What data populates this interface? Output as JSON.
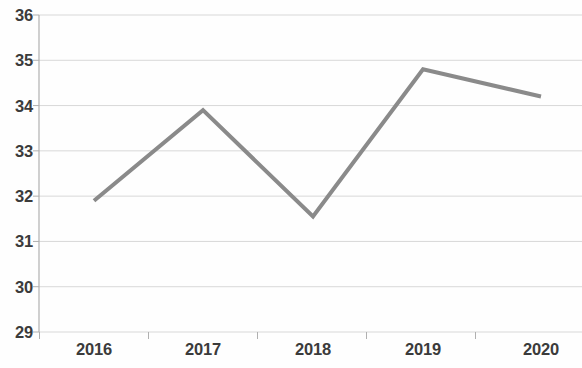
{
  "chart_data": {
    "type": "line",
    "title": "",
    "subtitle": "",
    "xlabel": "",
    "ylabel": "",
    "categories": [
      "2016",
      "2017",
      "2018",
      "2019",
      "2020"
    ],
    "values": [
      31.9,
      33.9,
      31.55,
      34.8,
      34.2
    ],
    "series": [
      {
        "name": "",
        "values": [
          31.9,
          33.9,
          31.55,
          34.8,
          34.2
        ]
      }
    ],
    "ylim": [
      29,
      36
    ],
    "yticks": [
      29,
      30,
      31,
      32,
      33,
      34,
      35,
      36
    ],
    "ytick_labels": [
      "29",
      "30",
      "31",
      "32",
      "33",
      "34",
      "35",
      "36"
    ],
    "xtick_labels": [
      "2016",
      "2017",
      "2018",
      "2019",
      "2020"
    ],
    "grid": true,
    "grid_axis": "y",
    "legend": false,
    "legend_position": "none",
    "markers": false,
    "colors": {
      "line": "#8a8a8a",
      "grid": "#d8d8d8",
      "axis": "#b0b0b0",
      "text": "#3b3b3b",
      "background": "#fefefe"
    },
    "line_width": 4,
    "annotations": []
  }
}
